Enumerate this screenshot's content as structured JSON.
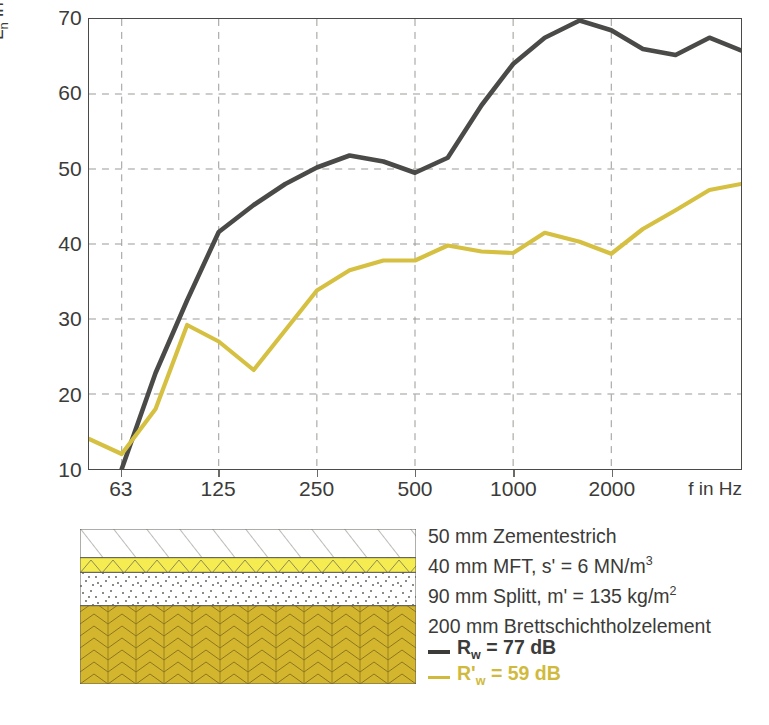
{
  "chart_data": {
    "type": "line",
    "title": "",
    "xlabel": "f in Hz",
    "ylabel": "L_n in dB",
    "ylabel_main": "L",
    "ylabel_sub": "n",
    "ylabel_tail": " in dB",
    "xscale": "log",
    "xlim": [
      50,
      5000
    ],
    "ylim": [
      10,
      70
    ],
    "grid": true,
    "legend_position": "below-figure",
    "y_ticks": [
      10,
      20,
      30,
      40,
      50,
      60,
      70
    ],
    "y_tick_labels": [
      "10",
      "20",
      "30",
      "40",
      "50",
      "60",
      "70"
    ],
    "x_ticks": [
      63,
      125,
      250,
      500,
      1000,
      2000
    ],
    "x_tick_labels": [
      "63",
      "125",
      "250",
      "500",
      "1000",
      "2000"
    ],
    "x_gridlines": [
      63,
      125,
      250,
      500,
      1000,
      2000
    ],
    "x": [
      50,
      63,
      80,
      100,
      125,
      160,
      200,
      250,
      315,
      400,
      500,
      630,
      800,
      1000,
      1250,
      1600,
      2000,
      2500,
      3150,
      4000,
      5000
    ],
    "series": [
      {
        "name": "R_w = 77 dB",
        "color": "#4a4a48",
        "values": [
          null,
          10.0,
          22.8,
          32.5,
          41.6,
          45.2,
          48.0,
          50.2,
          51.8,
          51.0,
          49.5,
          51.5,
          58.5,
          64.0,
          67.5,
          69.8,
          68.5,
          66.0,
          65.2,
          67.5,
          65.8
        ]
      },
      {
        "name": "R'_w = 59 dB",
        "color": "#d6c041",
        "values": [
          14.0,
          12.0,
          18.0,
          29.2,
          27.0,
          23.2,
          28.5,
          33.8,
          36.5,
          37.8,
          37.8,
          39.8,
          39.0,
          38.8,
          41.5,
          40.3,
          38.7,
          42.0,
          44.5,
          47.2,
          48.0
        ]
      }
    ]
  },
  "caption": {
    "lines": [
      {
        "text": "50 mm Zementestrich",
        "sup": ""
      },
      {
        "text": "40 mm MFT, s' = 6 MN/m",
        "sup": "3"
      },
      {
        "text": "90 mm Splitt, m' = 135 kg/m",
        "sup": "2"
      },
      {
        "text": "200 mm Brettschichtholzelement",
        "sup": ""
      }
    ],
    "legend": [
      {
        "label_main": "R",
        "label_sub": "w",
        "label_tail": " = 77 dB",
        "color": "#3b3b39"
      },
      {
        "label_main": "R'",
        "label_sub": "w",
        "label_tail": " = 59 dB",
        "color": "#d0ba3e"
      }
    ]
  },
  "section": {
    "layers": [
      {
        "name": "cement-screed",
        "pattern": "diagonal-hatch",
        "fill": "#ffffff",
        "height_pct": 18.5,
        "stroke": "#6f6f68"
      },
      {
        "name": "mft-insulation",
        "pattern": "zigzag",
        "fill": "#f5ec52",
        "height_pct": 9.5,
        "stroke": "#8a8a5a"
      },
      {
        "name": "gravel-fill",
        "pattern": "stipple",
        "fill": "#ffffff",
        "height_pct": 21.5,
        "stroke": "#6f6f68"
      },
      {
        "name": "glulam-element",
        "pattern": "herringbone",
        "fill": "#d4b52e",
        "height_pct": 50.5,
        "stroke": "#7a6a20"
      }
    ]
  },
  "colors": {
    "dark_curve": "#4a4a48",
    "yellow_curve": "#d6c041",
    "axis": "#4a4a48",
    "grid": "#9a9a96",
    "text": "#3b3b39"
  }
}
